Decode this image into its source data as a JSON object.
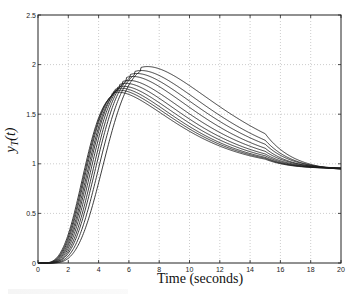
{
  "chart_data": {
    "type": "line",
    "title": "",
    "xlabel": "Time (seconds)",
    "ylabel": "y_T(t)",
    "ylabel_display": {
      "base": "y",
      "sub": "T",
      "arg": "(t)"
    },
    "xlim": [
      0,
      20
    ],
    "ylim": [
      0,
      2.5
    ],
    "xticks": [
      0,
      2,
      4,
      6,
      8,
      10,
      12,
      14,
      16,
      18,
      20
    ],
    "yticks": [
      0,
      0.5,
      1,
      1.5,
      2,
      2.5
    ],
    "ytick_labels": [
      "0",
      "0.5",
      "1",
      "1.5",
      "2",
      "2.5"
    ],
    "grid": true,
    "legend": null,
    "line_color": "#1a1a1a",
    "series": [
      {
        "name": "curve-1",
        "peak_t": 4.9,
        "peak_y": 1.74,
        "final": 0.95,
        "delay": 0.35
      },
      {
        "name": "curve-2",
        "peak_t": 5.0,
        "peak_y": 1.76,
        "final": 0.95,
        "delay": 0.4
      },
      {
        "name": "curve-3",
        "peak_t": 5.1,
        "peak_y": 1.78,
        "final": 0.95,
        "delay": 0.45
      },
      {
        "name": "curve-4",
        "peak_t": 5.25,
        "peak_y": 1.8,
        "final": 0.95,
        "delay": 0.5
      },
      {
        "name": "curve-5",
        "peak_t": 5.4,
        "peak_y": 1.83,
        "final": 0.95,
        "delay": 0.55
      },
      {
        "name": "curve-6",
        "peak_t": 5.6,
        "peak_y": 1.86,
        "final": 0.95,
        "delay": 0.6
      },
      {
        "name": "curve-7",
        "peak_t": 5.85,
        "peak_y": 1.9,
        "final": 0.94,
        "delay": 0.65
      },
      {
        "name": "curve-8",
        "peak_t": 6.1,
        "peak_y": 1.93,
        "final": 0.94,
        "delay": 0.7
      },
      {
        "name": "curve-9",
        "peak_t": 6.4,
        "peak_y": 1.96,
        "final": 0.93,
        "delay": 0.8
      },
      {
        "name": "curve-10",
        "peak_t": 6.8,
        "peak_y": 2.0,
        "final": 0.92,
        "delay": 0.9
      }
    ]
  }
}
